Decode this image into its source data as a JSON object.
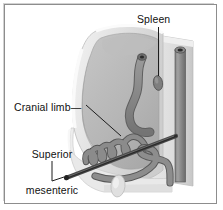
{
  "figure": {
    "domain_note": "grayscale anatomical line illustration",
    "frame": {
      "border_color": "#8d8d8d",
      "background_color": "#ffffff",
      "highlight_color": "#d2d2d2"
    }
  },
  "labels": {
    "spleen": "Spleen",
    "cranial_limb": "Cranial limb—",
    "sma_line1": "Superior",
    "sma_line2": "mesenteric",
    "sma_line3": "artery"
  },
  "colors": {
    "text": "#111111",
    "leader_line": "#1d1d1d",
    "cavity_outer_wall": "#dcdcdc",
    "cavity_rim": "#f7f7f7",
    "cavity_interior_light": "#c9c9c9",
    "cavity_interior_mid": "#b4b4b4",
    "cavity_shadow": "#a3a3a3",
    "body_block_light": "#e4e4e4",
    "body_block_mid": "#cfcfcf",
    "bowel_gray": "#8a8a8a",
    "bowel_dark": "#6f6f6f",
    "bowel_outline": "#5a5a5a",
    "vessel_gray": "#8f8f8f",
    "vessel_dark": "#6b6b6b",
    "lumen_dark": "#3a3a3a",
    "artery_rod": "#2f2f2f",
    "spleen_fill": "#7e7e7e"
  },
  "structures": {
    "spleen": "small dark oval organ, upper right of cavity",
    "cranial_limb": "serpentine coiled loops of proximal small intestine, left of center",
    "superior_mesenteric_artery": "thin dark rod running diagonally from lower left to upper right",
    "vertical_vessel": "large vertical cylindrical vessel at right margin with dark circular lumen",
    "descending_bowel": "S-shaped bowel tube descending through the center of the cavity",
    "caudal_loop": "lower bowel arc sweeping right toward the vertical vessel",
    "cavity_wall": "cut-away abdominal wall forming a rounded cup open at the front left"
  }
}
